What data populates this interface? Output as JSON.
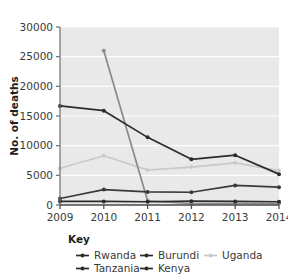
{
  "figure": {
    "background": "#ffffff",
    "plot_background": "#e9e9e9",
    "grid_color": "#ffffff",
    "axis_color": "#6f6f6f"
  },
  "axes": {
    "ylabel": "No. of deaths",
    "yticks": [
      "0",
      "5000",
      "10000",
      "15000",
      "20000",
      "25000",
      "30000"
    ],
    "xticks": [
      "2009",
      "2010",
      "2011",
      "2012",
      "2013",
      "2014"
    ]
  },
  "legend": {
    "title": "Key",
    "items": [
      {
        "label": "Rwanda",
        "color": "#2b2b2b"
      },
      {
        "label": "Burundi",
        "color": "#2b2b2b"
      },
      {
        "label": "Uganda",
        "color": "#c9c9c9"
      },
      {
        "label": "Tanzania",
        "color": "#2b2b2b"
      },
      {
        "label": "Kenya",
        "color": "#2b2b2b"
      }
    ]
  },
  "chart_data": {
    "type": "line",
    "title": "",
    "xlabel": "",
    "ylabel": "No. of deaths",
    "x": [
      2009,
      2010,
      2011,
      2012,
      2013,
      2014
    ],
    "categories": [
      "2009",
      "2010",
      "2011",
      "2012",
      "2013",
      "2014"
    ],
    "ylim": [
      0,
      30000
    ],
    "xlim": [
      2009,
      2014
    ],
    "ytick_values": [
      0,
      5000,
      10000,
      15000,
      20000,
      25000,
      30000
    ],
    "grid": "horizontal",
    "legend_position": "bottom",
    "series": [
      {
        "name": "Rwanda",
        "color": "#2b2b2b",
        "values": [
          16700,
          15900,
          11400,
          7700,
          8400,
          5200
        ]
      },
      {
        "name": "Burundi",
        "color": "#3a3a3a",
        "values": [
          1100,
          2600,
          2200,
          2150,
          3300,
          3000
        ]
      },
      {
        "name": "Uganda",
        "color": "#c9c9c9",
        "values": [
          6200,
          8300,
          5900,
          6400,
          7100,
          5800
        ]
      },
      {
        "name": "Tanzania",
        "color": "#2b2b2b",
        "values": [
          600,
          600,
          550,
          650,
          600,
          550
        ]
      },
      {
        "name": "Kenya",
        "color": "#8a8a8a",
        "values": [
          null,
          26000,
          700,
          250,
          250,
          250
        ]
      }
    ]
  }
}
